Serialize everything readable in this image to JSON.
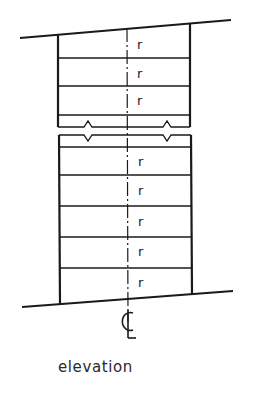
{
  "diagram": {
    "caption": "elevation",
    "centerline_symbol": "℄",
    "riser_label": "r",
    "upper_flight": {
      "riser_labels": [
        "r",
        "r",
        "r"
      ],
      "tread_lines_y": [
        58,
        86,
        115
      ]
    },
    "lower_flight": {
      "riser_labels": [
        "r",
        "r",
        "r",
        "r",
        "r"
      ],
      "tread_lines_y": [
        147,
        175,
        206,
        237,
        268
      ]
    },
    "break_marks": 2,
    "colors": {
      "line": "#1a1a1a",
      "background": "#ffffff"
    }
  }
}
